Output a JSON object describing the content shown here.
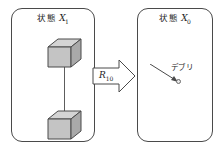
{
  "figure": {
    "background_color": "#ffffff",
    "line_color": "#4a4a4a",
    "tether_color": "#5d5d5d"
  },
  "panels": {
    "left": {
      "state_word": "状態",
      "variable": "X",
      "subscript": "1",
      "objects": [
        {
          "name": "satellite-cube-top"
        },
        {
          "name": "satellite-cube-bottom"
        }
      ],
      "tether": {
        "name": "tether-line"
      }
    },
    "right": {
      "state_word": "状態",
      "variable": "X",
      "subscript": "0",
      "objects": [
        {
          "name": "satellite-cube-top"
        },
        {
          "name": "satellite-cube-bottom"
        }
      ],
      "tether": {
        "name": "tether-line"
      },
      "debris": {
        "label": "デブリ",
        "dot_color": "#e8e8e8",
        "dot_border_color": "#6b6b6b"
      }
    }
  },
  "transition": {
    "symbol": "R",
    "subscript": "10",
    "direction": "right",
    "fill_color": "#ffffff",
    "stroke_color": "#4a4a4a"
  },
  "cube_style": {
    "top_face_color": "#d4d4d4",
    "front_face_color": "#c4c4c4",
    "side_face_color": "#a9a9a9",
    "edge_color": "#4a4a4a"
  }
}
